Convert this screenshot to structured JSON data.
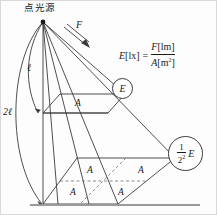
{
  "diagram": {
    "title_label": "点光源",
    "flux_arrow_label": "F",
    "distance_near_label": "ℓ",
    "distance_far_label": "2ℓ",
    "area_label": "A",
    "near_illuminance_label": "E",
    "far_illuminance": {
      "numerator": "1",
      "denominator": "2",
      "denominator_exponent": "2",
      "symbol": "E"
    },
    "formula": {
      "lhs_symbol": "E",
      "lhs_unit": "[lx]",
      "equals": "=",
      "numerator_symbol": "F",
      "numerator_unit": "[lm]",
      "denominator_symbol": "A",
      "denominator_unit": "[m",
      "denominator_unit_exponent": "2",
      "denominator_unit_close": "]"
    },
    "near_plane_cells": [
      "A"
    ],
    "far_plane_cells": [
      "A",
      "A",
      "A",
      "A"
    ],
    "colors": {
      "stroke": "#3b3b3b",
      "dashed": "#6f6f6f",
      "baseline": "#9a9a9a",
      "background": "#fdfdfd",
      "border": "#d9d9d9"
    }
  }
}
